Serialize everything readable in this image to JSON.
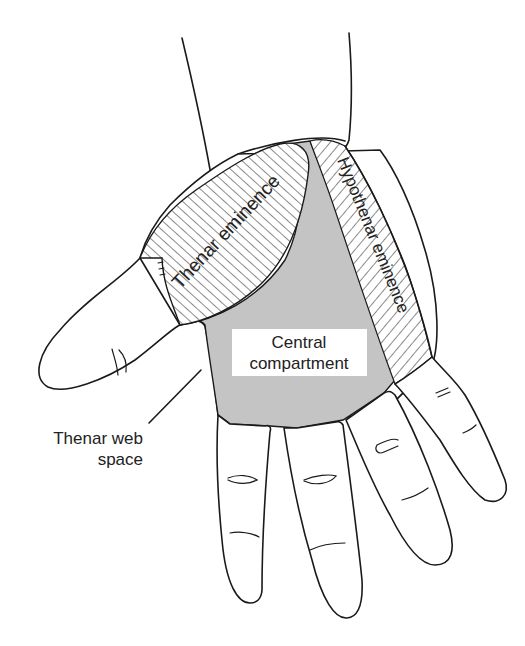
{
  "figure": {
    "colors": {
      "outline": "#1a1a1a",
      "central_fill": "#c4c4c4",
      "hatch": "#2a2a2a",
      "background": "#ffffff",
      "text": "#222222"
    }
  },
  "labels": {
    "thenar_eminence": "Thenar eminence",
    "hypothenar_eminence": "Hypothenar eminence",
    "central_line1": "Central",
    "central_line2": "compartment",
    "web_line1": "Thenar web",
    "web_line2": "space"
  },
  "regions": [
    {
      "id": "thenar-eminence",
      "fill": "diagonal hatch"
    },
    {
      "id": "hypothenar-eminence",
      "fill": "diagonal hatch"
    },
    {
      "id": "central-compartment",
      "fill": "gray"
    },
    {
      "id": "thenar-web-space",
      "fill": "none",
      "indicator": "leader line"
    }
  ]
}
